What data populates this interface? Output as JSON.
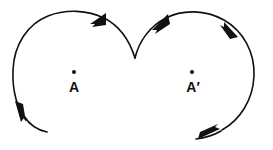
{
  "figure": {
    "background_color": "#ffffff",
    "stroke_color": "#111111",
    "width": 273,
    "height": 150,
    "labels": {
      "left_point": "A",
      "right_point": "A′"
    },
    "points": [
      {
        "name": "A",
        "x": 74,
        "y": 72,
        "label": "A"
      },
      {
        "name": "A-prime",
        "x": 192,
        "y": 72,
        "label": "A′"
      }
    ],
    "loops": [
      {
        "name": "left-loop",
        "center_x": 74,
        "center_y": 72,
        "radius": 60,
        "direction": "counterclockwise",
        "open_gap": "bottom-left",
        "arrow_count": 2
      },
      {
        "name": "right-loop",
        "center_x": 192,
        "center_y": 72,
        "radius": 62,
        "direction": "clockwise",
        "open_gap": "bottom",
        "arrow_count": 2
      }
    ],
    "cusp": {
      "x": 135,
      "y": 58
    },
    "arrows": [
      {
        "name": "arrow-top-left",
        "x": 100,
        "y": 16,
        "direction": "right-up"
      },
      {
        "name": "arrow-upper-mid",
        "x": 161,
        "y": 22,
        "direction": "up-right"
      },
      {
        "name": "arrow-top-right",
        "x": 232,
        "y": 29,
        "direction": "down-right"
      },
      {
        "name": "arrow-bottom-right",
        "x": 212,
        "y": 133,
        "direction": "down-left"
      },
      {
        "name": "arrow-bottom-left",
        "x": 21,
        "y": 110,
        "direction": "up-left"
      }
    ]
  }
}
